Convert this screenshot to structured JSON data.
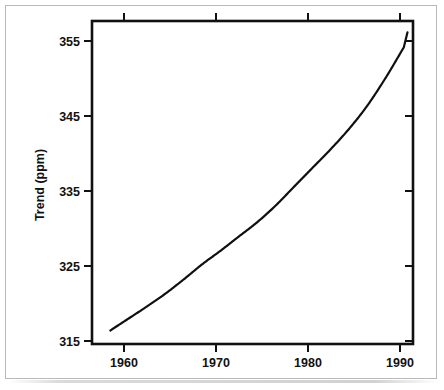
{
  "chart_data": {
    "type": "line",
    "title": "",
    "subtitle": "",
    "xlabel": "",
    "ylabel": "Trend (ppm)",
    "xlim": [
      1957,
      1992
    ],
    "ylim": [
      313.5,
      356.5
    ],
    "grid": false,
    "legend": null,
    "xticks": [
      1960,
      1970,
      1980,
      1990
    ],
    "xtick_labels": [
      "1960",
      "1970",
      "1980",
      "1990"
    ],
    "yticks": [
      315,
      325,
      335,
      345,
      355
    ],
    "ytick_labels": [
      "315",
      "325",
      "335",
      "345",
      "355"
    ],
    "series": [
      {
        "name": "Trend",
        "x": [
          1959,
          1961,
          1963,
          1965,
          1967,
          1969,
          1971,
          1973,
          1975,
          1977,
          1979,
          1981,
          1983,
          1985,
          1987,
          1989,
          1991
        ],
        "values": [
          315.3,
          316.9,
          318.5,
          320.2,
          322.1,
          324.1,
          325.9,
          327.8,
          329.7,
          331.9,
          334.4,
          336.9,
          339.4,
          342.1,
          345.2,
          348.9,
          353.0
        ]
      }
    ],
    "line_color": "#101010",
    "axis_color": "#111111",
    "background_color": "#ffffff",
    "endpoints": {
      "start": {
        "x": 1959,
        "y": 315.3
      },
      "end": {
        "x": 1991.4,
        "y": 355.0
      }
    }
  },
  "figure": {
    "frame_color": "#b9b9b9",
    "paper_color": "#ffffff"
  }
}
